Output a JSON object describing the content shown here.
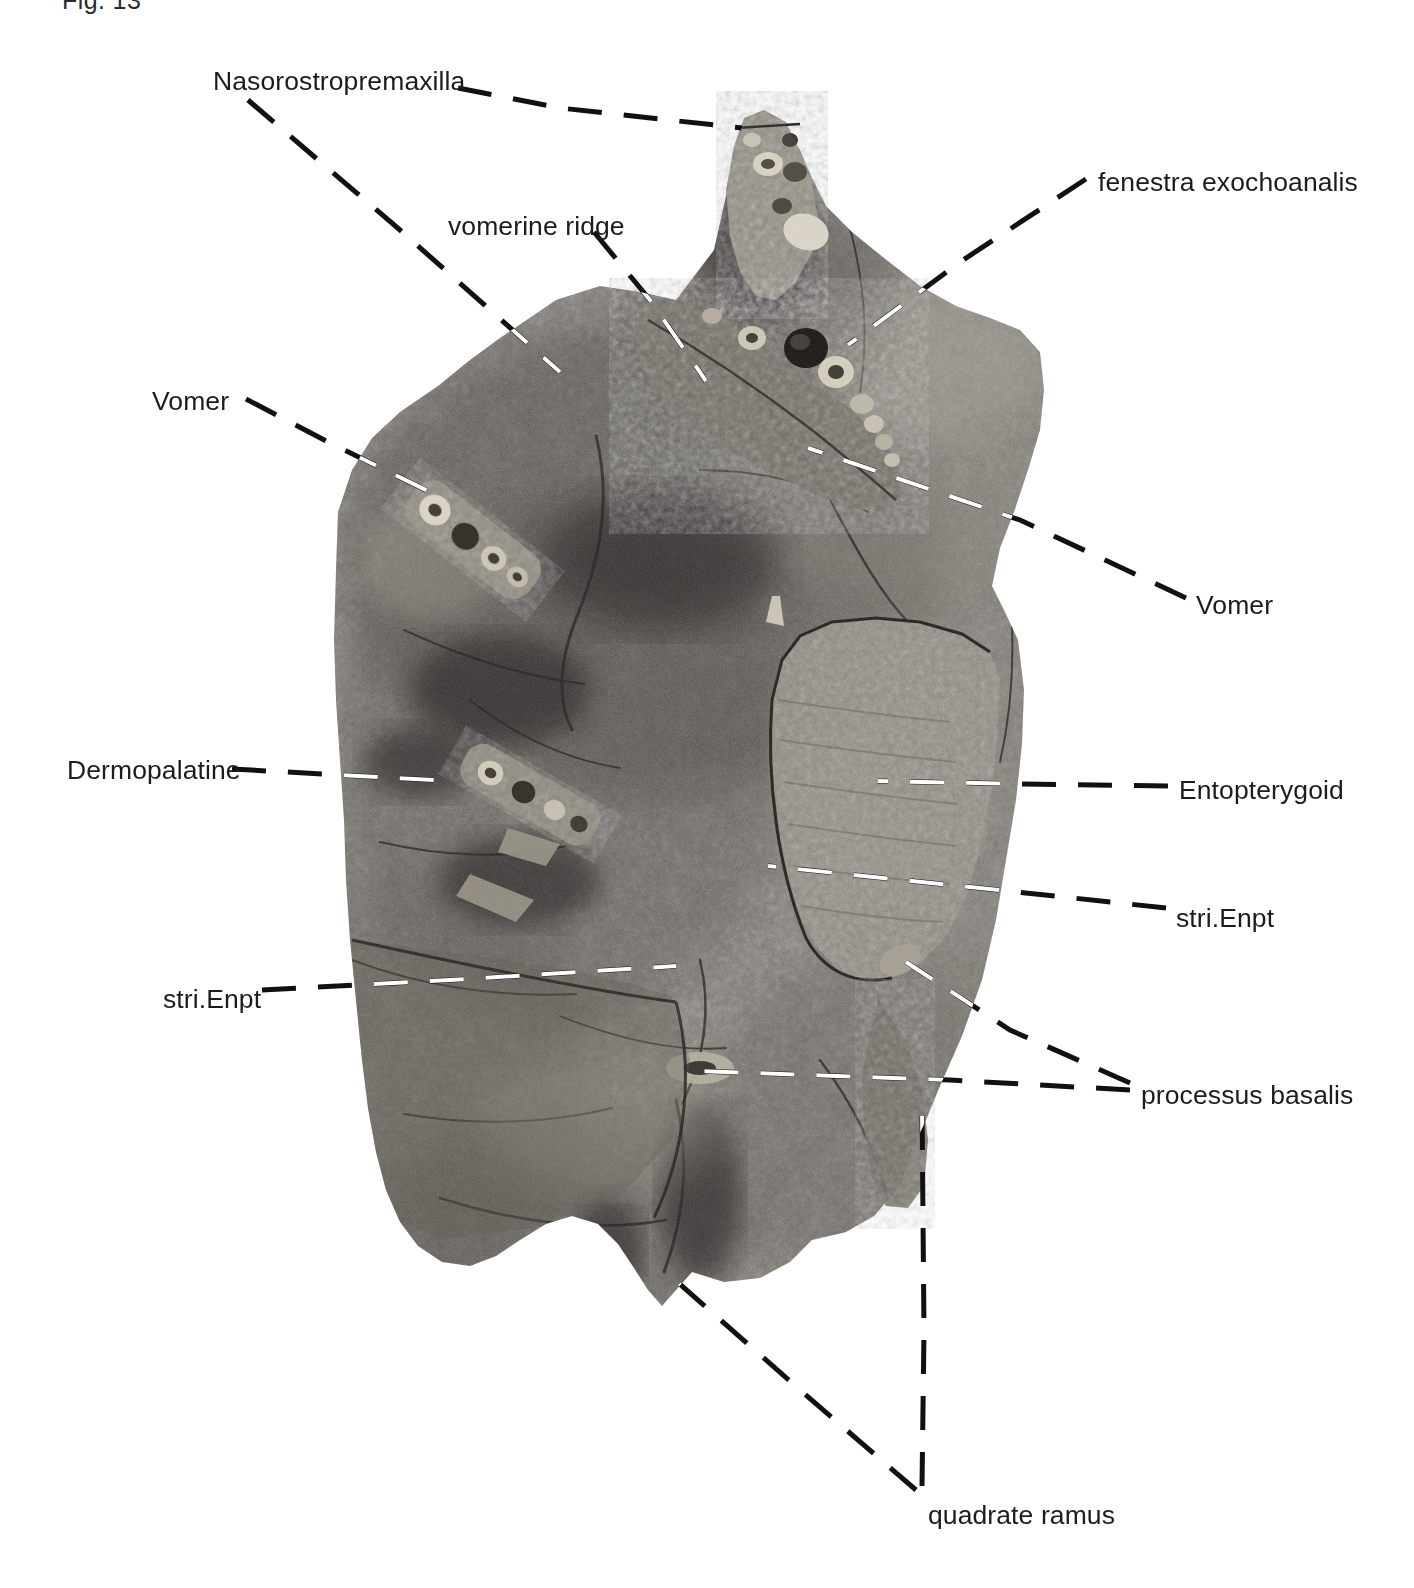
{
  "figure": {
    "number": "Fig. 13",
    "caption_visible": false,
    "background_color": "#ffffff",
    "ink_color": "#1c1c1c",
    "leader_line_dark": "#111111",
    "leader_line_light": "#ffffff",
    "specimen_description": "black-and-white photograph of a fossil fish skull in palatal view preserved in rock matrix",
    "view": "palatal view"
  },
  "labels": [
    {
      "id": "nasorostropremaxilla",
      "text": "Nasorostropremaxilla",
      "align": "left",
      "x": 213,
      "y": 66
    },
    {
      "id": "vomerine-ridge",
      "text": "vomerine ridge",
      "align": "left",
      "x": 448,
      "y": 211
    },
    {
      "id": "fenestra-exochoanalis",
      "text": "fenestra exochoanalis",
      "align": "left",
      "x": 1098,
      "y": 167
    },
    {
      "id": "vomer-left",
      "text": "Vomer",
      "align": "left",
      "x": 152,
      "y": 386
    },
    {
      "id": "vomer-right",
      "text": "Vomer",
      "align": "left",
      "x": 1196,
      "y": 590
    },
    {
      "id": "dermopalatine",
      "text": "Dermopalatine",
      "align": "left",
      "x": 67,
      "y": 755
    },
    {
      "id": "entopterygoid",
      "text": "Entopterygoid",
      "align": "left",
      "x": 1179,
      "y": 775
    },
    {
      "id": "stri-enpt-right",
      "text": "stri.Enpt",
      "align": "left",
      "x": 1176,
      "y": 903
    },
    {
      "id": "stri-enpt-left",
      "text": "stri.Enpt",
      "align": "left",
      "x": 163,
      "y": 984
    },
    {
      "id": "processus-basalis",
      "text": "processus basalis",
      "align": "left",
      "x": 1141,
      "y": 1080
    },
    {
      "id": "quadrate-ramus",
      "text": "quadrate ramus",
      "align": "left",
      "x": 928,
      "y": 1500
    }
  ],
  "leaders": [
    {
      "id": "leader-nasorostropremaxilla-a",
      "target_label": "nasorostropremaxilla",
      "points": "458,88 560,108 742,128"
    },
    {
      "id": "leader-nasorostropremaxilla-b",
      "target_label": "nasorostropremaxilla",
      "points": "248,100 400,230 560,372"
    },
    {
      "id": "leader-vomerine-ridge",
      "target_label": "vomerine-ridge",
      "points": "594,232 650,300 706,381"
    },
    {
      "id": "leader-fenestra-exochoanalis",
      "target_label": "fenestra-exochoanalis",
      "points": "1086,179 960,262 848,345"
    },
    {
      "id": "leader-vomer-left",
      "target_label": "vomer-left",
      "points": "246,399 330,443 430,492"
    },
    {
      "id": "leader-vomer-right",
      "target_label": "vomer-right",
      "points": "1186,598 1020,520 808,448"
    },
    {
      "id": "leader-dermopalatine",
      "target_label": "dermopalatine",
      "points": "232,769 340,775 452,781"
    },
    {
      "id": "leader-entopterygoid",
      "target_label": "entopterygoid",
      "points": "1168,786 1020,784 878,781"
    },
    {
      "id": "leader-stri-enpt-right",
      "target_label": "stri-enpt-right",
      "points": "1166,908 980,888 768,866"
    },
    {
      "id": "leader-stri-enpt-left",
      "target_label": "stri-enpt-left",
      "points": "262,990 450,980 676,966"
    },
    {
      "id": "leader-processus-basalis-a",
      "target_label": "processus-basalis",
      "points": "1130,1083 1010,1030 906,962"
    },
    {
      "id": "leader-processus-basalis-b",
      "target_label": "processus-basalis",
      "points": "1130,1090 950,1080 700,1071"
    },
    {
      "id": "leader-quadrate-ramus-a",
      "target_label": "quadrate-ramus",
      "points": "916,1490 800,1390 666,1272"
    },
    {
      "id": "leader-quadrate-ramus-b",
      "target_label": "quadrate-ramus",
      "points": "922,1486 924,1330 922,1106"
    }
  ]
}
